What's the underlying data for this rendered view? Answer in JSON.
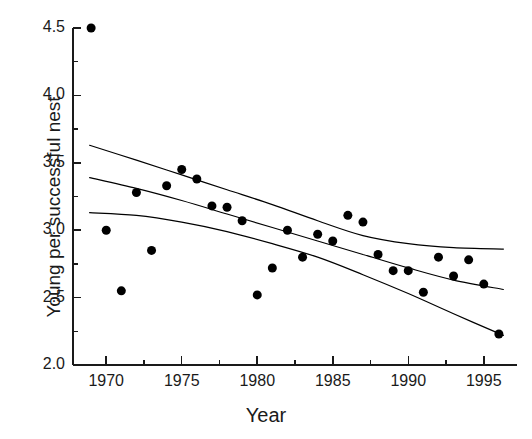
{
  "chart_data": {
    "type": "scatter",
    "title": "",
    "xlabel": "Year",
    "ylabel": "Young per successful nest",
    "xlim": [
      1967.8,
      1997.2
    ],
    "ylim": [
      2.0,
      4.5
    ],
    "grid": false,
    "legend": null,
    "x_major_ticks": [
      1970,
      1975,
      1980,
      1985,
      1990,
      1995
    ],
    "x_tick_labels": [
      "1970",
      "1975",
      "1980",
      "1985",
      "1990",
      "1995"
    ],
    "x_minor_ticks": [
      1972.5,
      1977.5,
      1982.5,
      1987.5,
      1992.5
    ],
    "y_major_ticks": [
      2.0,
      2.5,
      3.0,
      3.5,
      4.0,
      4.5
    ],
    "y_tick_labels": [
      "2.0",
      "2.5",
      "3.0",
      "3.5",
      "4.0",
      "4.5"
    ],
    "y_minor_ticks": [
      2.25,
      2.75,
      3.25,
      3.75,
      4.25
    ],
    "marker": "filled-circle",
    "marker_color": "#000000",
    "marker_size": 9,
    "points": [
      {
        "x": 1969.0,
        "y": 4.5
      },
      {
        "x": 1970.0,
        "y": 3.0
      },
      {
        "x": 1971.0,
        "y": 2.55
      },
      {
        "x": 1972.0,
        "y": 3.28
      },
      {
        "x": 1973.0,
        "y": 2.85
      },
      {
        "x": 1974.0,
        "y": 3.33
      },
      {
        "x": 1975.0,
        "y": 3.45
      },
      {
        "x": 1976.0,
        "y": 3.38
      },
      {
        "x": 1977.0,
        "y": 3.18
      },
      {
        "x": 1978.0,
        "y": 3.17
      },
      {
        "x": 1979.0,
        "y": 3.07
      },
      {
        "x": 1980.0,
        "y": 2.52
      },
      {
        "x": 1981.0,
        "y": 2.72
      },
      {
        "x": 1982.0,
        "y": 3.0
      },
      {
        "x": 1983.0,
        "y": 2.8
      },
      {
        "x": 1984.0,
        "y": 2.97
      },
      {
        "x": 1985.0,
        "y": 2.92
      },
      {
        "x": 1986.0,
        "y": 3.11
      },
      {
        "x": 1987.0,
        "y": 3.06
      },
      {
        "x": 1988.0,
        "y": 2.82
      },
      {
        "x": 1989.0,
        "y": 2.7
      },
      {
        "x": 1990.0,
        "y": 2.7
      },
      {
        "x": 1991.0,
        "y": 2.54
      },
      {
        "x": 1992.0,
        "y": 2.8
      },
      {
        "x": 1993.0,
        "y": 2.66
      },
      {
        "x": 1994.0,
        "y": 2.78
      },
      {
        "x": 1995.0,
        "y": 2.6
      },
      {
        "x": 1996.0,
        "y": 2.23
      }
    ],
    "lines": [
      {
        "name": "upper-confidence-band",
        "color": "#000000",
        "width": 1.2,
        "points": [
          {
            "x": 1968.9,
            "y": 3.63
          },
          {
            "x": 1972.0,
            "y": 3.52
          },
          {
            "x": 1975.0,
            "y": 3.41
          },
          {
            "x": 1978.0,
            "y": 3.3
          },
          {
            "x": 1981.0,
            "y": 3.19
          },
          {
            "x": 1984.0,
            "y": 3.07
          },
          {
            "x": 1987.0,
            "y": 2.96
          },
          {
            "x": 1990.0,
            "y": 2.9
          },
          {
            "x": 1993.0,
            "y": 2.87
          },
          {
            "x": 1996.3,
            "y": 2.86
          }
        ]
      },
      {
        "name": "regression-line",
        "color": "#000000",
        "width": 1.2,
        "points": [
          {
            "x": 1968.9,
            "y": 3.39
          },
          {
            "x": 1972.0,
            "y": 3.31
          },
          {
            "x": 1975.0,
            "y": 3.22
          },
          {
            "x": 1978.0,
            "y": 3.12
          },
          {
            "x": 1981.0,
            "y": 3.02
          },
          {
            "x": 1984.0,
            "y": 2.92
          },
          {
            "x": 1987.0,
            "y": 2.82
          },
          {
            "x": 1990.0,
            "y": 2.72
          },
          {
            "x": 1993.0,
            "y": 2.63
          },
          {
            "x": 1996.3,
            "y": 2.56
          }
        ]
      },
      {
        "name": "lower-confidence-band",
        "color": "#000000",
        "width": 1.2,
        "points": [
          {
            "x": 1968.9,
            "y": 3.13
          },
          {
            "x": 1972.0,
            "y": 3.11
          },
          {
            "x": 1975.0,
            "y": 3.06
          },
          {
            "x": 1978.0,
            "y": 2.99
          },
          {
            "x": 1981.0,
            "y": 2.9
          },
          {
            "x": 1984.0,
            "y": 2.8
          },
          {
            "x": 1987.0,
            "y": 2.67
          },
          {
            "x": 1990.0,
            "y": 2.53
          },
          {
            "x": 1993.0,
            "y": 2.38
          },
          {
            "x": 1996.3,
            "y": 2.22
          }
        ]
      }
    ]
  },
  "geometry": {
    "plot_left": 73,
    "plot_right": 517,
    "plot_bottom": 365,
    "plot_top": 28,
    "x_pixel_per_year": 15.2,
    "y_pixel_per_unit": 124.8
  }
}
